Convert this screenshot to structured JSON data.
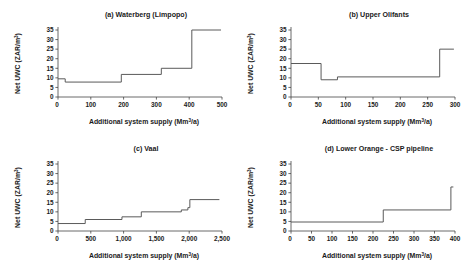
{
  "figure": {
    "panel_count": 4,
    "y_axis_label": "Net UWC (ZAR/m³)",
    "x_axis_label": "Additional system supply (Mm³/a)",
    "x_axis_label_base": "Additional system supply (Mm",
    "x_axis_label_sup": "3",
    "x_axis_label_tail": "/a)",
    "y_axis_label_base": "Net UWC (ZAR/m",
    "y_axis_label_sup": "3",
    "y_axis_label_tail": ")",
    "line_color": "#5a5a5a",
    "axis_color": "#444444",
    "background": "#ffffff"
  },
  "chart_data": [
    {
      "type": "line",
      "subtype": "step",
      "panel": "a",
      "title": "(a) Waterberg (Limpopo)",
      "xlabel": "Additional system supply (Mm³/a)",
      "ylabel": "Net UWC (ZAR/m³)",
      "xlim": [
        0,
        500
      ],
      "ylim": [
        0,
        35
      ],
      "xticks": [
        0,
        100,
        200,
        300,
        400,
        500
      ],
      "xticklabels": [
        "0",
        "100",
        "200",
        "300",
        "400",
        "500"
      ],
      "yticks": [
        0,
        5,
        10,
        15,
        20,
        25,
        30,
        35
      ],
      "yticklabels": [
        "0",
        "5",
        "10",
        "15",
        "20",
        "25",
        "30",
        "35"
      ],
      "grid": false,
      "legend": null,
      "steps": [
        {
          "x_start": 0,
          "x_end": 22,
          "y": 9.5
        },
        {
          "x_start": 22,
          "x_end": 193,
          "y": 7.8
        },
        {
          "x_start": 193,
          "x_end": 315,
          "y": 11.8
        },
        {
          "x_start": 315,
          "x_end": 408,
          "y": 15.0
        },
        {
          "x_start": 408,
          "x_end": 497,
          "y": 35.0
        }
      ]
    },
    {
      "type": "line",
      "subtype": "step",
      "panel": "b",
      "title": "(b) Upper Olifants",
      "xlabel": "Additional system supply (Mm³/a)",
      "ylabel": "Net UWC (ZAR/m³)",
      "xlim": [
        0,
        300
      ],
      "ylim": [
        0,
        35
      ],
      "xticks": [
        0,
        50,
        100,
        150,
        200,
        250,
        300
      ],
      "xticklabels": [
        "0",
        "50",
        "100",
        "150",
        "200",
        "250",
        "300"
      ],
      "yticks": [
        0,
        5,
        10,
        15,
        20,
        25,
        30,
        35
      ],
      "yticklabels": [
        "0",
        "5",
        "10",
        "15",
        "20",
        "25",
        "30",
        "35"
      ],
      "grid": false,
      "legend": null,
      "steps": [
        {
          "x_start": 0,
          "x_end": 55,
          "y": 17.5
        },
        {
          "x_start": 55,
          "x_end": 85,
          "y": 9.0
        },
        {
          "x_start": 85,
          "x_end": 272,
          "y": 10.5
        },
        {
          "x_start": 272,
          "x_end": 298,
          "y": 25.0
        }
      ]
    },
    {
      "type": "line",
      "subtype": "step",
      "panel": "c",
      "title": "(c) Vaal",
      "xlabel": "Additional system supply (Mm³/a)",
      "ylabel": "Net UWC (ZAR/m³)",
      "xlim": [
        0,
        2500
      ],
      "ylim": [
        0,
        35
      ],
      "xticks": [
        0,
        500,
        1000,
        1500,
        2000,
        2500
      ],
      "xticklabels": [
        "0",
        "500",
        "1,000",
        "1,500",
        "2,000",
        "2,500"
      ],
      "yticks": [
        0,
        5,
        10,
        15,
        20,
        25,
        30,
        35
      ],
      "yticklabels": [
        "0",
        "5",
        "10",
        "15",
        "20",
        "25",
        "30",
        "35"
      ],
      "grid": false,
      "legend": null,
      "steps": [
        {
          "x_start": 0,
          "x_end": 415,
          "y": 3.9
        },
        {
          "x_start": 415,
          "x_end": 975,
          "y": 6.0
        },
        {
          "x_start": 975,
          "x_end": 1270,
          "y": 7.4
        },
        {
          "x_start": 1270,
          "x_end": 1880,
          "y": 10.0
        },
        {
          "x_start": 1880,
          "x_end": 1980,
          "y": 11.0
        },
        {
          "x_start": 1980,
          "x_end": 2010,
          "y": 12.2
        },
        {
          "x_start": 2010,
          "x_end": 2460,
          "y": 16.4
        }
      ]
    },
    {
      "type": "line",
      "subtype": "step",
      "panel": "d",
      "title": "(d) Lower Orange - CSP pipeline",
      "xlabel": "Additional system supply (Mm³/a)",
      "ylabel": "Net UWC (ZAR/m³)",
      "xlim": [
        0,
        400
      ],
      "ylim": [
        0,
        35
      ],
      "xticks": [
        0,
        50,
        100,
        150,
        200,
        250,
        300,
        350,
        400
      ],
      "xticklabels": [
        "0",
        "50",
        "100",
        "150",
        "200",
        "250",
        "300",
        "350",
        "400"
      ],
      "yticks": [
        0,
        5,
        10,
        15,
        20,
        25,
        30,
        35
      ],
      "yticklabels": [
        "0",
        "5",
        "10",
        "15",
        "20",
        "25",
        "30",
        "35"
      ],
      "grid": false,
      "legend": null,
      "steps": [
        {
          "x_start": 0,
          "x_end": 225,
          "y": 4.7
        },
        {
          "x_start": 225,
          "x_end": 390,
          "y": 11.0
        },
        {
          "x_start": 390,
          "x_end": 396,
          "y": 23.0
        }
      ]
    }
  ]
}
